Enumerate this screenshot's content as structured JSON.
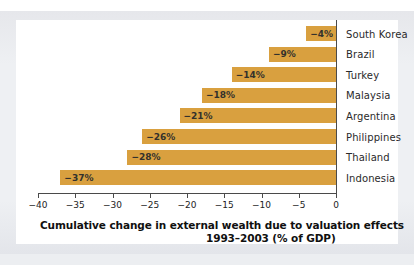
{
  "page": {
    "top_sliver_ghost_text": "",
    "accent_color": "#D9A03F",
    "axis_color": "#4A4A4A",
    "frame_color": "#E9EAEE",
    "card_background": "#FFFFFF"
  },
  "caption": {
    "line1": "Cumulative change in external wealth due to valuation effects",
    "line2": "1993–2003 (% of GDP)"
  },
  "chart_data": {
    "type": "bar",
    "orientation": "horizontal",
    "xlabel": "",
    "ylabel": "",
    "xlim": [
      -40,
      0
    ],
    "grid": false,
    "legend": null,
    "tick_labels": [
      "−40",
      "−35",
      "−30",
      "−25",
      "−20",
      "−15",
      "−10",
      "−5",
      "0"
    ],
    "ticks": [
      -40,
      -35,
      -30,
      -25,
      -20,
      -15,
      -10,
      -5,
      0
    ],
    "categories": [
      "South Korea",
      "Brazil",
      "Turkey",
      "Malaysia",
      "Argentina",
      "Philippines",
      "Thailand",
      "Indonesia"
    ],
    "values": [
      -4,
      -9,
      -14,
      -18,
      -21,
      -26,
      -28,
      -37
    ],
    "data_labels": [
      "−4%",
      "−9%",
      "−14%",
      "−18%",
      "−21%",
      "−26%",
      "−28%",
      "−37%"
    ],
    "bar_color": "#D9A03F"
  }
}
